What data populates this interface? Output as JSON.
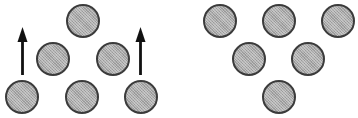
{
  "figure": {
    "width": 358,
    "height": 118,
    "background_color": "#ffffff"
  },
  "style": {
    "circle_fill_color": "#a9a9a9",
    "circle_border_color": "#3b3b3b",
    "circle_border_width": 2,
    "circle_diameter": 34,
    "arrow_color": "#111111"
  },
  "panels": [
    {
      "id": "left",
      "name": "left-circle-group",
      "x": 0,
      "width": 179,
      "circle_count": 6,
      "arrow_count": 2,
      "circles": [
        {
          "name": "circle-top-center",
          "cx": 83,
          "cy": 21,
          "d": 34
        },
        {
          "name": "circle-mid-left",
          "cx": 53,
          "cy": 59,
          "d": 34
        },
        {
          "name": "circle-mid-right",
          "cx": 113,
          "cy": 59,
          "d": 34
        },
        {
          "name": "circle-bottom-left",
          "cx": 22,
          "cy": 97,
          "d": 34
        },
        {
          "name": "circle-bottom-center",
          "cx": 82,
          "cy": 97,
          "d": 34
        },
        {
          "name": "circle-bottom-right",
          "cx": 141,
          "cy": 97,
          "d": 34
        }
      ],
      "arrows": [
        {
          "name": "arrow-up-left",
          "cx": 22,
          "top": 27,
          "bottom": 75,
          "direction": "up"
        },
        {
          "name": "arrow-up-right",
          "cx": 140,
          "top": 27,
          "bottom": 75,
          "direction": "up"
        }
      ]
    },
    {
      "id": "right",
      "name": "right-circle-group",
      "x": 179,
      "width": 179,
      "circle_count": 6,
      "arrow_count": 0,
      "circles": [
        {
          "name": "circle-top-left",
          "cx": 41,
          "cy": 21,
          "d": 34
        },
        {
          "name": "circle-top-center",
          "cx": 100,
          "cy": 21,
          "d": 34
        },
        {
          "name": "circle-top-right",
          "cx": 159,
          "cy": 21,
          "d": 34
        },
        {
          "name": "circle-mid-left",
          "cx": 70,
          "cy": 59,
          "d": 34
        },
        {
          "name": "circle-mid-right",
          "cx": 129,
          "cy": 59,
          "d": 34
        },
        {
          "name": "circle-bottom-center",
          "cx": 100,
          "cy": 97,
          "d": 34
        }
      ],
      "arrows": []
    }
  ]
}
